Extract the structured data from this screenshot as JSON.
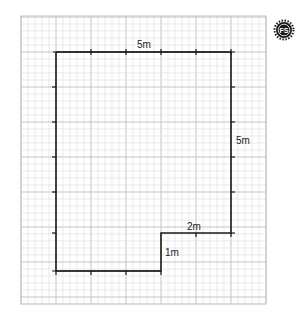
{
  "diagram": {
    "type": "floor-plan",
    "grid": {
      "x": 21,
      "y": 16,
      "width": 245,
      "height": 288,
      "minor": 7,
      "major": 35,
      "minor_color": "#dcdcdc",
      "major_color": "#c4c4c4"
    },
    "outline_color": "#1a1a1a",
    "labels": {
      "top": "5m",
      "right": "5m",
      "step_top": "2m",
      "step_side": "1m"
    },
    "logo": {
      "text": "FS",
      "color": "#1a1a1a"
    }
  }
}
